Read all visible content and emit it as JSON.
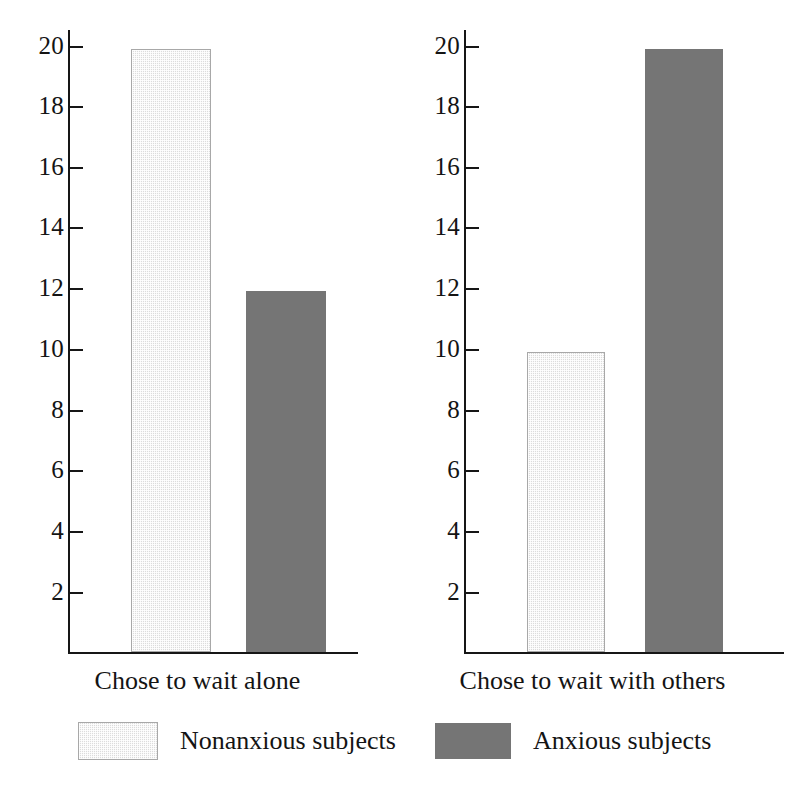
{
  "chart_data": {
    "type": "bar",
    "title": "",
    "subtitle": "",
    "xlabel": "",
    "ylabel": "",
    "ylim": [
      0,
      21
    ],
    "grid": false,
    "legend_position": "bottom",
    "categories": [
      "Chose to wait alone",
      "Chose to wait with others"
    ],
    "series": [
      {
        "name": "Nonanxious subjects",
        "color": "#dcdcdc",
        "values": [
          19.9,
          9.9
        ]
      },
      {
        "name": "Anxious subjects",
        "color": "#757575",
        "values": [
          11.9,
          19.9
        ]
      }
    ],
    "y_ticks": [
      2,
      4,
      6,
      8,
      10,
      12,
      14,
      16,
      18,
      20
    ],
    "y_tick_labels": [
      "2",
      "4",
      "6",
      "8",
      "10",
      "12",
      "14",
      "16",
      "18",
      "20"
    ]
  },
  "panels": [
    {
      "id": "left",
      "category_label": "Chose to wait alone",
      "bars": [
        {
          "series": "Nonanxious subjects",
          "value": 19.9
        },
        {
          "series": "Anxious subjects",
          "value": 11.9
        }
      ]
    },
    {
      "id": "right",
      "category_label": "Chose to wait with others",
      "bars": [
        {
          "series": "Nonanxious subjects",
          "value": 9.9
        },
        {
          "series": "Anxious subjects",
          "value": 19.9
        }
      ]
    }
  ],
  "axis": {
    "tick_labels": [
      "20",
      "18",
      "16",
      "14",
      "12",
      "10",
      "8",
      "6",
      "4",
      "2"
    ]
  },
  "legend": {
    "items": [
      {
        "label": "Nonanxious subjects",
        "swatch": "light-stippled-swatch",
        "color": "#dcdcdc"
      },
      {
        "label": "Anxious subjects",
        "swatch": "dark-gray-swatch",
        "color": "#757575"
      }
    ]
  }
}
